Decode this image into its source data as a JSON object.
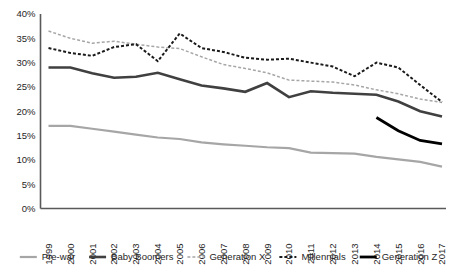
{
  "chart_data": {
    "type": "line",
    "title": "",
    "xlabel": "",
    "ylabel": "",
    "ylim": [
      0,
      40
    ],
    "ytick_labels": [
      "0%",
      "5%",
      "10%",
      "15%",
      "20%",
      "25%",
      "30%",
      "35%",
      "40%"
    ],
    "ytick_values": [
      0,
      5,
      10,
      15,
      20,
      25,
      30,
      35,
      40
    ],
    "grid": false,
    "legend_position": "bottom",
    "categories": [
      1999,
      2000,
      2001,
      2002,
      2003,
      2004,
      2005,
      2006,
      2007,
      2008,
      2009,
      2010,
      2011,
      2012,
      2013,
      2014,
      2015,
      2016,
      2017
    ],
    "x_tick_labels": [
      "1999",
      "2000",
      "2001",
      "2002",
      "2003",
      "2004",
      "2005",
      "2006",
      "2007",
      "2008",
      "2009",
      "2010",
      "2011",
      "2012",
      "2013",
      "2014",
      "2015",
      "2016",
      "2017"
    ],
    "series": [
      {
        "name": "Pre-war",
        "color": "#A6A6A6",
        "style": "solid",
        "width": 2.2,
        "start_index": 0,
        "values": [
          17.0,
          17.0,
          16.4,
          15.8,
          15.2,
          14.6,
          14.3,
          13.6,
          13.2,
          12.9,
          12.6,
          12.4,
          11.5,
          11.4,
          11.3,
          10.6,
          10.1,
          9.6,
          8.6
        ]
      },
      {
        "name": "Baby Boomers",
        "color": "#404040",
        "style": "solid",
        "width": 2.6,
        "start_index": 0,
        "values": [
          29.0,
          29.0,
          27.8,
          26.9,
          27.1,
          27.9,
          26.6,
          25.3,
          24.7,
          24.0,
          25.8,
          22.9,
          24.1,
          23.8,
          23.6,
          23.4,
          22.0,
          20.0,
          18.9
        ]
      },
      {
        "name": "Generation X",
        "color": "#A6A6A6",
        "style": "dashed",
        "width": 1.5,
        "start_index": 0,
        "values": [
          36.5,
          35.0,
          34.0,
          34.4,
          33.8,
          33.2,
          32.9,
          31.2,
          29.6,
          28.8,
          27.9,
          26.4,
          26.2,
          26.0,
          25.4,
          24.4,
          23.6,
          22.5,
          21.8
        ]
      },
      {
        "name": "Millennials",
        "color": "#1A1A1A",
        "style": "dashed",
        "width": 2.0,
        "start_index": 0,
        "values": [
          33.0,
          32.0,
          31.4,
          33.2,
          33.8,
          30.3,
          36.0,
          33.0,
          32.2,
          31.0,
          30.6,
          30.8,
          30.0,
          29.2,
          27.2,
          30.0,
          29.0,
          25.4,
          21.9
        ]
      },
      {
        "name": "Generation Z",
        "color": "#000000",
        "style": "solid",
        "width": 2.8,
        "start_index": 15,
        "values": [
          null,
          null,
          null,
          null,
          null,
          null,
          null,
          null,
          null,
          null,
          null,
          null,
          null,
          null,
          null,
          18.7,
          16.0,
          14.0,
          13.3
        ]
      }
    ]
  },
  "legend": {
    "items": [
      {
        "label": "Pre-war"
      },
      {
        "label": "Baby Boomers"
      },
      {
        "label": "Generation X"
      },
      {
        "label": "Millennials"
      },
      {
        "label": "Generation Z"
      }
    ]
  }
}
